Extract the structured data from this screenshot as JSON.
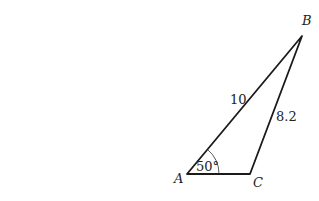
{
  "diagram": {
    "type": "triangle",
    "vertices": {
      "A": {
        "label": "A"
      },
      "B": {
        "label": "B"
      },
      "C": {
        "label": "C"
      }
    },
    "sides": {
      "AB": {
        "label": "10"
      },
      "BC": {
        "label": "8.2"
      }
    },
    "angles": {
      "A": {
        "label": "50°"
      }
    },
    "colors": {
      "stroke": "#1a1a1a",
      "text": "#222222"
    }
  }
}
